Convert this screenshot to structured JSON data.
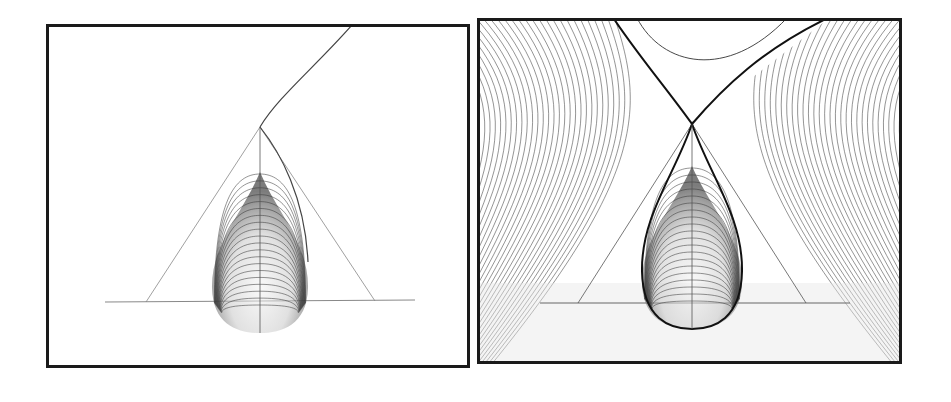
{
  "figure": {
    "panels": [
      {
        "id": "left",
        "description": "Teardrop-shaped family of nested contour curves with triangular bounding lines, a vertical axis, a horizontal baseline, and a single curve extending from the apex to the top edge",
        "background": "#ffffff",
        "frame_color": "#1a1a1a",
        "contour_count": 22
      },
      {
        "id": "right",
        "description": "Same teardrop contour family with a separatrix crossing at the apex (X-shaped), hyperbolic contour lines filling the surrounding field, and one U-shaped curve at the top",
        "background": "#ffffff",
        "frame_color": "#1a1a1a",
        "contour_count": 22,
        "field_line_count": 40
      }
    ],
    "colors": {
      "line": "#333333",
      "light_line": "#888888",
      "frame": "#1a1a1a",
      "shade_dark": "#111111"
    }
  }
}
